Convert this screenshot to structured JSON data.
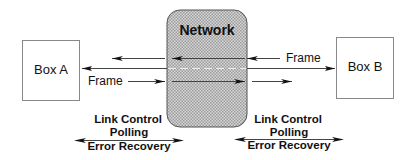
{
  "diagram": {
    "network": {
      "label": "Network"
    },
    "box_a": {
      "label": "Box A"
    },
    "box_b": {
      "label": "Box B"
    },
    "frames": {
      "from_b_label": "Frame",
      "from_a_label": "Frame"
    },
    "link_left": {
      "line1": "Link Control",
      "line2": "Polling",
      "line3": "Error Recovery"
    },
    "link_right": {
      "line1": "Link Control",
      "line2": "Polling",
      "line3": "Error Recovery"
    },
    "colors": {
      "network_fill_light": "#d8d8d8",
      "network_fill_dark": "#9a9a9a",
      "stroke": "#222222",
      "box_stroke": "#888888"
    }
  }
}
